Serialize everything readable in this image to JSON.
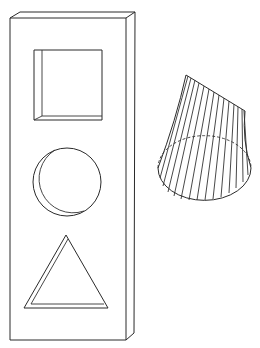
{
  "figure": {
    "colors": {
      "line": "#2a2a2a",
      "background": "#ffffff"
    },
    "slab": {
      "shape": "rectangular-prism",
      "cutouts": [
        "square",
        "circle",
        "triangle"
      ]
    },
    "ruled_surface": {
      "shape": "twisted-cone",
      "base": "ellipse",
      "hidden_edge": "dashed"
    }
  }
}
